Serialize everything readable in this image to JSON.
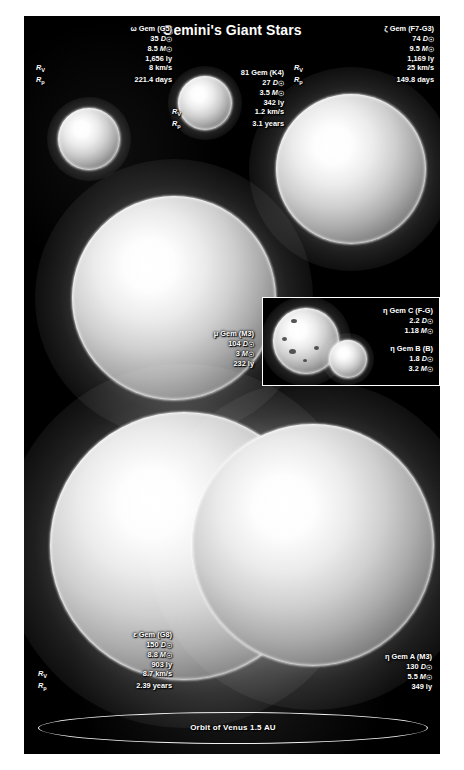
{
  "title": "Gemini's Giant Stars",
  "units": {
    "diameter": "D",
    "mass": "M",
    "sun_symbol": "☉",
    "lightyear": "ly",
    "km_per_s": "km/s",
    "days": "days",
    "years": "years",
    "rv_symbol": "R",
    "rv_sub": "V",
    "rp_symbol": "R",
    "rp_sub": "p"
  },
  "stars": [
    {
      "id": "omega-gem",
      "name": "ω Gem (G5)",
      "diameter": "35",
      "mass": "8.5",
      "distance": "1,656 ly",
      "rv": "8 km/s",
      "rp": "221.4 days"
    },
    {
      "id": "81-gem",
      "name": "81 Gem (K4)",
      "diameter": "27",
      "mass": "3.5",
      "distance": "342 ly",
      "rv": "1.2 km/s",
      "rp": "3.1 years"
    },
    {
      "id": "zeta-gem",
      "name": "ζ Gem (F7-G3)",
      "diameter": "74",
      "mass": "9.5",
      "distance": "1,169 ly",
      "rv": "25 km/s",
      "rp": "149.8 days"
    },
    {
      "id": "mu-gem",
      "name": "μ Gem (M3)",
      "diameter": "104",
      "mass": "3",
      "distance": "232 ly",
      "rv": null,
      "rp": null
    },
    {
      "id": "epsilon-gem",
      "name": "ε Gem (G8)",
      "diameter": "150",
      "mass": "8.8",
      "distance": "903 ly",
      "rv": "8.7 km/s",
      "rp": "2.39 years"
    },
    {
      "id": "eta-gem-a",
      "name": "η Gem A (M3)",
      "diameter": "130",
      "mass": "5.5",
      "distance": "349 ly",
      "rv": null,
      "rp": null
    },
    {
      "id": "eta-gem-c",
      "name": "η Gem C (F-G)",
      "diameter": "2.2",
      "mass": "1.18",
      "distance": null,
      "rv": null,
      "rp": null
    },
    {
      "id": "eta-gem-b",
      "name": "η Gem B (B)",
      "diameter": "1.8",
      "mass": "3.2",
      "distance": null,
      "rv": null,
      "rp": null
    }
  ],
  "venus_orbit": {
    "label": "Orbit of Venus 1.5 AU"
  },
  "colors": {
    "background": "#000000",
    "page": "#ffffff",
    "text": "#ffffff",
    "orbit_line": "#f2f2f2",
    "inset_border": "#ffffff"
  }
}
